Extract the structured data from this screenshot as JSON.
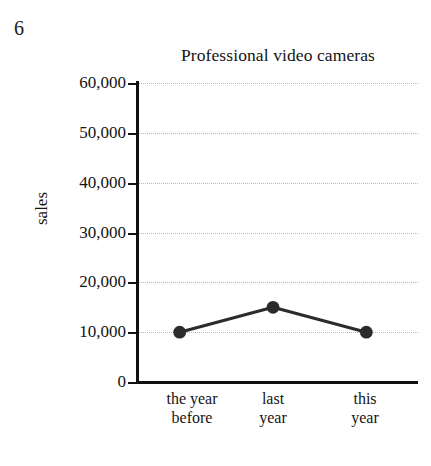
{
  "figure_number": "6",
  "chart_data": {
    "type": "line",
    "title": "Professional video cameras",
    "xlabel": "",
    "ylabel": "sales",
    "categories": [
      "the year before",
      "last year",
      "this year"
    ],
    "category_lines": [
      {
        "line1": "the year",
        "line2": "before"
      },
      {
        "line1": "last",
        "line2": "year"
      },
      {
        "line1": "this",
        "line2": "year"
      }
    ],
    "values": [
      10000,
      15000,
      10000
    ],
    "point_labels": [
      "10,000",
      "15,000",
      "10,000"
    ],
    "ylim": [
      0,
      60000
    ],
    "ytick_values": [
      0,
      10000,
      20000,
      30000,
      40000,
      50000,
      60000
    ],
    "ytick_labels": [
      "0",
      "10,000",
      "20,000",
      "30,000",
      "40,000",
      "50,000",
      "60,000"
    ],
    "grid": true,
    "grid_axis": "y",
    "grid_style": "dotted",
    "legend": false,
    "series_color": "#2b2b2b",
    "grid_color": "#b9b9b9",
    "axis_color": "#111111",
    "marker": "circle"
  }
}
